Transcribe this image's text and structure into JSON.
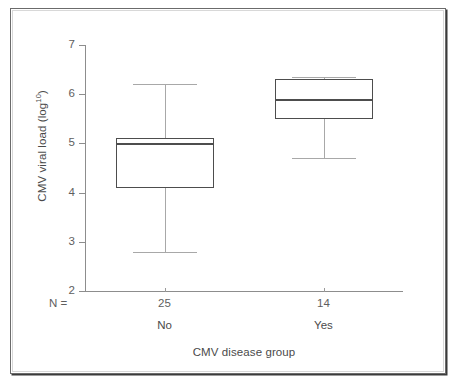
{
  "figure": {
    "y_axis_title_main": "CMV viral load (log",
    "y_axis_title_sup": "10",
    "y_axis_title_close": ")",
    "x_axis_title": "CMV disease group",
    "n_row_label": "N =",
    "tick_labels_y": [
      "7",
      "6",
      "5",
      "4",
      "3",
      "2"
    ],
    "colors": {
      "box_stroke": "#4d4d4d",
      "whisker_stroke": "#a8a8a8",
      "axis_stroke": "#8d8d8d",
      "text": "#4a4a4a",
      "frame": "#6b6b6b",
      "background": "#ffffff"
    }
  },
  "chart_data": {
    "type": "box",
    "title": "",
    "xlabel": "CMV disease group",
    "ylabel": "CMV viral load (log10)",
    "ylim": [
      2,
      7
    ],
    "yticks": [
      2,
      3,
      4,
      5,
      6,
      7
    ],
    "grid": false,
    "legend": "none",
    "categories": [
      "No",
      "Yes"
    ],
    "group_counts": [
      25,
      14
    ],
    "group_count_labels": [
      "25",
      "14"
    ],
    "boxes": [
      {
        "category": "No",
        "n": 25,
        "n_label": "25",
        "min": 2.8,
        "q1": 4.1,
        "median": 5.0,
        "q3": 5.1,
        "max": 6.2,
        "outliers": []
      },
      {
        "category": "Yes",
        "n": 14,
        "n_label": "14",
        "min": 4.7,
        "q1": 5.5,
        "median": 5.9,
        "q3": 6.3,
        "max": 6.35,
        "outliers": []
      }
    ]
  }
}
